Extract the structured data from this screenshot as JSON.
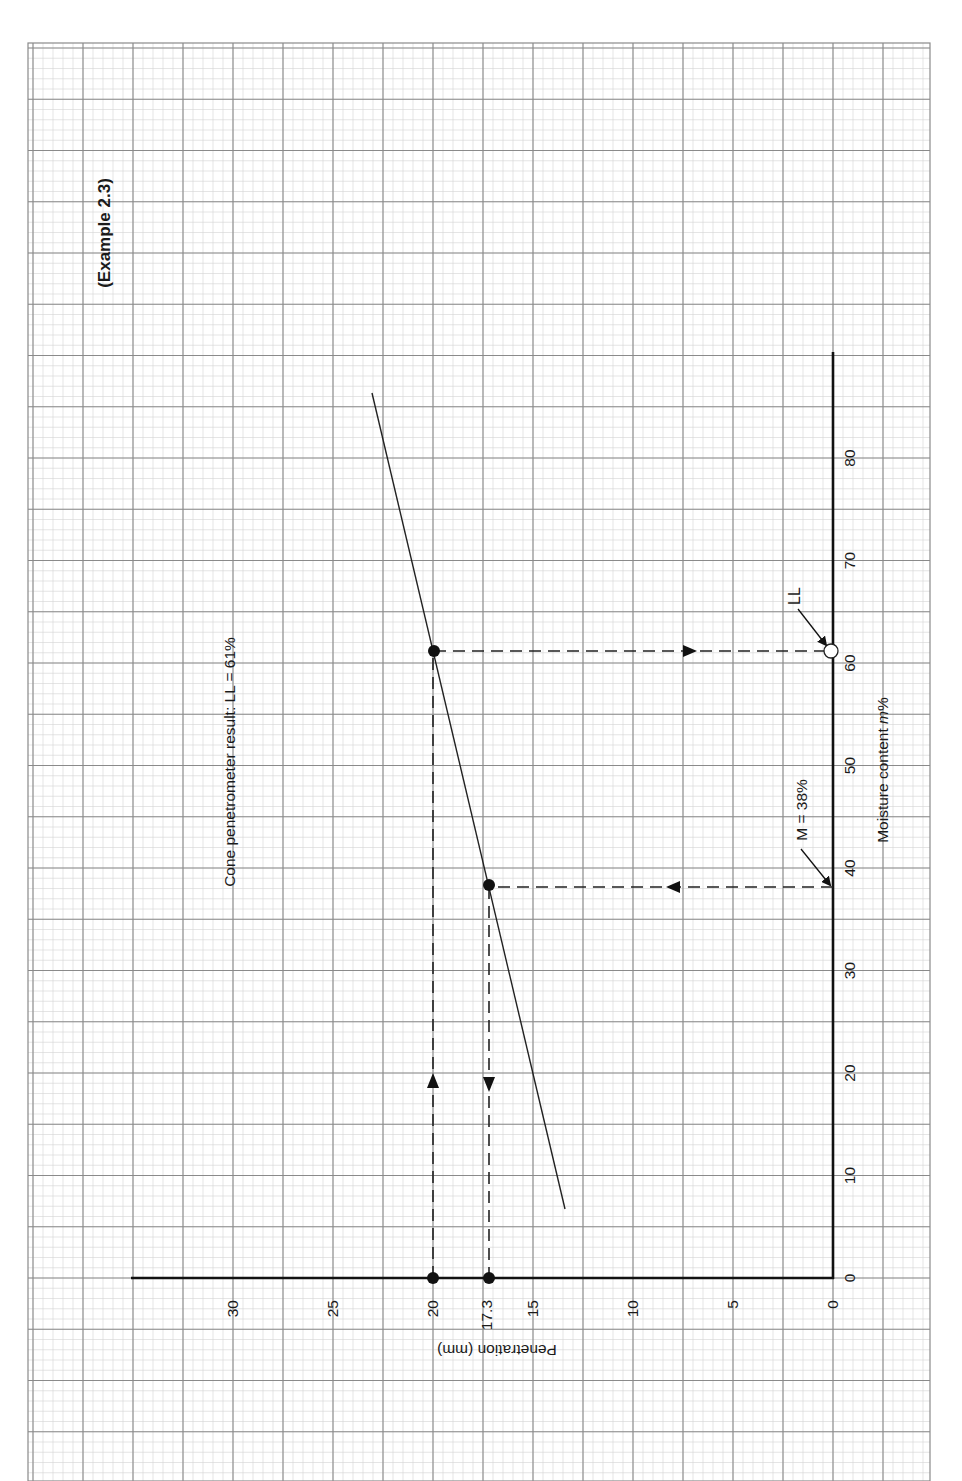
{
  "page": {
    "example_label": "(Example 2.3)",
    "result_label": "Cone penetrometer result: LL = 61%",
    "ll_marker_label": "LL",
    "m_marker_label": "M = 38%",
    "x_axis_label_prefix": "Moisture content ",
    "x_axis_label_var": "m",
    "x_axis_label_suffix": "%",
    "y_axis_label": "Penetration (mm)",
    "colors": {
      "paper": "#ffffff",
      "grid_major": "#8a8a8a",
      "grid_minor": "#d4d4d4",
      "ink": "#111111"
    }
  },
  "chart_data": {
    "type": "line",
    "title": "Cone penetrometer result: LL = 61%",
    "annotation_title": "(Example 2.3)",
    "orientation": "rotated 90° counter-clockwise on graph paper",
    "xlabel": "Moisture content m%",
    "ylabel": "Penetration (mm)",
    "xlim": [
      0,
      90
    ],
    "ylim": [
      0,
      35
    ],
    "x_ticks": [
      0,
      10,
      20,
      30,
      40,
      50,
      60,
      70,
      80
    ],
    "y_ticks": [
      0,
      5,
      10,
      15,
      17.3,
      20,
      25,
      30
    ],
    "grid": true,
    "series": [
      {
        "name": "Penetration vs moisture content (best-fit line)",
        "style": "solid",
        "x": [
          7,
          38,
          61,
          86
        ],
        "y": [
          13.4,
          17.2,
          20.0,
          23.0
        ]
      },
      {
        "name": "Read points",
        "style": "markers",
        "x": [
          38,
          61
        ],
        "y": [
          17.3,
          20.0
        ]
      }
    ],
    "annotations": [
      {
        "text": "LL",
        "x": 61,
        "y": 0,
        "marker": "open-circle",
        "meaning": "Liquid limit = 61% at 20 mm penetration"
      },
      {
        "text": "M = 38%",
        "x": 38,
        "y": 0,
        "marker": "arrow",
        "meaning": "Moisture content 38% gives 17.3 mm"
      },
      {
        "text": "17.3",
        "x": 0,
        "y": 17.3,
        "marker": "filled-dot"
      },
      {
        "text": "20",
        "x": 0,
        "y": 20,
        "marker": "filled-dot"
      }
    ]
  }
}
